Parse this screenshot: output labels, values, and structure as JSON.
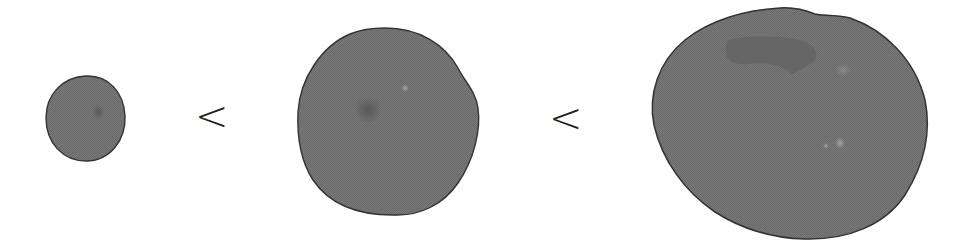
{
  "figure": {
    "shapes": [
      {
        "id": "shape-small",
        "label": "small",
        "size_rank": 1
      },
      {
        "id": "shape-medium",
        "label": "medium",
        "size_rank": 2
      },
      {
        "id": "shape-large",
        "label": "large",
        "size_rank": 3
      }
    ],
    "comparators": [
      {
        "symbol": "<"
      },
      {
        "symbol": "<"
      }
    ]
  },
  "colors": {
    "fill": "#737373",
    "outline": "#333333",
    "dark_patch": "#5a5a5a",
    "light_speck": "#9a9a9a",
    "comparator": "#222222",
    "background": "#ffffff"
  }
}
